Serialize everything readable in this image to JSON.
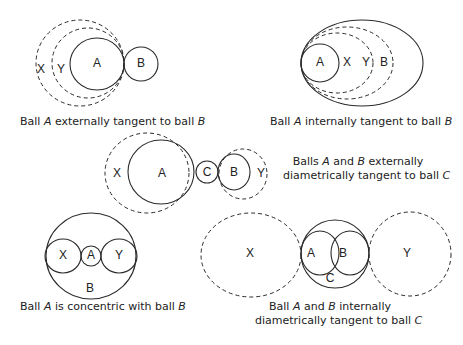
{
  "diagrams": [
    {
      "id": "externally-tangent",
      "labels": [
        "X",
        "Y",
        "A",
        "B"
      ],
      "caption": {
        "pre": "Ball ",
        "a": "A",
        "mid": " externally tangent to ball ",
        "b": "B"
      }
    },
    {
      "id": "internally-tangent",
      "labels": [
        "A",
        "X",
        "Y",
        "B"
      ],
      "caption": {
        "pre": "Ball ",
        "a": "A",
        "mid": " internally tangent to ball ",
        "b": "B"
      }
    },
    {
      "id": "externally-diametrically-tangent",
      "labels": [
        "X",
        "A",
        "C",
        "B",
        "Y"
      ],
      "caption": {
        "line1_pre": "Balls ",
        "a": "A",
        "line1_mid": " and ",
        "b": "B",
        "line1_post": " externally",
        "line2_pre": "diametrically tangent to ball ",
        "c": "C"
      }
    },
    {
      "id": "concentric",
      "labels": [
        "X",
        "A",
        "Y",
        "B"
      ],
      "caption": {
        "pre": "Ball ",
        "a": "A",
        "mid": " is concentric with ball ",
        "b": "B"
      }
    },
    {
      "id": "internally-diametrically-tangent",
      "labels": [
        "X",
        "A",
        "B",
        "C",
        "Y"
      ],
      "caption": {
        "line1_pre": "Ball ",
        "a": "A",
        "line1_mid": " and ",
        "b": "B",
        "line1_post": " internally",
        "line2_pre": "diametrically tangent to ball ",
        "c": "C"
      }
    }
  ],
  "colors": {
    "stroke": "#2a2a2a",
    "background": "#ffffff",
    "text": "#222222"
  }
}
